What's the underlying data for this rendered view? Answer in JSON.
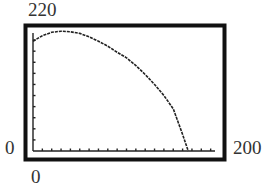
{
  "chart_data": {
    "type": "line",
    "title": "",
    "xlabel": "",
    "ylabel": "",
    "xlim": [
      0,
      200
    ],
    "ylim": [
      0,
      220
    ],
    "x_tick_step": 10,
    "y_tick_step": 20,
    "grid": false,
    "legend": null,
    "window_labels": {
      "ymax": "220",
      "ymin": "0",
      "xmin": "0",
      "xmax": "200"
    },
    "series": [
      {
        "name": "curve",
        "x": [
          0,
          10,
          20,
          30,
          40,
          50,
          60,
          70,
          80,
          90,
          100,
          110,
          120,
          130,
          140,
          150,
          160,
          166
        ],
        "values": [
          198,
          208,
          214,
          216,
          215,
          212,
          206,
          198,
          189,
          178,
          168,
          154,
          138,
          120,
          100,
          76,
          30,
          0
        ]
      }
    ]
  },
  "labels": {
    "ymax": "220",
    "yzero": "0",
    "xzero": "0",
    "xmax": "200"
  },
  "colors": {
    "frame": "#111111",
    "curve": "#222222",
    "axis": "#222222",
    "background": "#ffffff"
  }
}
